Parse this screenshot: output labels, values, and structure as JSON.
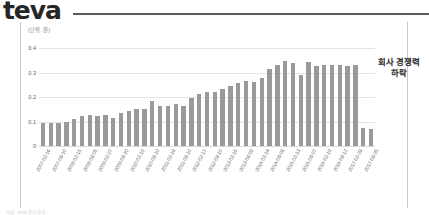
{
  "header": {
    "logo_text": "teva"
  },
  "annotation": {
    "line1": "회사 경쟁력",
    "line2": "하락"
  },
  "caption": {
    "text": "자료 : teva 주가 추이"
  },
  "colors": {
    "bar": "#9a9a9a",
    "grid": "#e4e4e4",
    "logo": "#262626",
    "rule": "#5a5a5a",
    "frame": "#c9c9c9",
    "axis_text": "#5e5e5e"
  },
  "chart_data": {
    "type": "bar",
    "title": "",
    "unit_label": "(단위 : 원)",
    "xlabel": "",
    "ylabel": "",
    "ylim": [
      0,
      0.45
    ],
    "yticks": [
      "0",
      "0.1",
      "0.2",
      "0.3",
      "0.4"
    ],
    "ytick_values": [
      0,
      0.1,
      0.2,
      0.3,
      0.4
    ],
    "grid": true,
    "legend": "none",
    "categories": [
      "2007-02-16",
      "2007-05-15",
      "2007-08-10",
      "2007-11-15",
      "2008-02-15",
      "2008-05-15",
      "2008-08-05",
      "2008-11-14",
      "2009-02-27",
      "2009-05-15",
      "2009-08-10",
      "2009-11-13",
      "2010-02-19",
      "2010-05-14",
      "2010-08-10",
      "2010-11-12",
      "2011-02-18",
      "2011-05-13",
      "2011-08-10",
      "2011-11-10",
      "2012-02-17",
      "2012-05-11",
      "2012-08-10",
      "2012-11-09",
      "2013-02-15",
      "2013-05-10",
      "2013-08-09",
      "2013-11-08",
      "2014-02-14",
      "2014-05-09",
      "2014-08-08",
      "2014-11-07",
      "2015-02-13",
      "2015-05-08",
      "2015-08-07",
      "2015-11-06",
      "2016-02-19",
      "2016-05-13",
      "2016-08-12",
      "2016-11-18",
      "2017-02-28",
      "2017-05-19",
      "2017-08-25"
    ],
    "tick_labels": [
      "2007-02-16",
      "2007-08-10",
      "2008-02-15",
      "2008-08-05",
      "2009-02-27",
      "2009-08-10",
      "2010-02-19",
      "2010-08-10",
      "2011-02-18",
      "2011-08-10",
      "2012-02-17",
      "2012-08-10",
      "2013-02-15",
      "2013-08-09",
      "2014-02-14",
      "2014-08-08",
      "2015-02-13",
      "2015-08-07",
      "2016-02-19",
      "2016-08-12",
      "2017-02-28",
      "2017-08-25"
    ],
    "values": [
      0.095,
      0.095,
      0.093,
      0.097,
      0.112,
      0.122,
      0.125,
      0.122,
      0.127,
      0.113,
      0.135,
      0.143,
      0.15,
      0.152,
      0.185,
      0.162,
      0.165,
      0.172,
      0.163,
      0.196,
      0.211,
      0.222,
      0.222,
      0.232,
      0.245,
      0.258,
      0.265,
      0.262,
      0.277,
      0.315,
      0.332,
      0.348,
      0.338,
      0.292,
      0.345,
      0.328,
      0.33,
      0.33,
      0.33,
      0.328,
      0.33,
      0.072,
      0.07
    ]
  }
}
